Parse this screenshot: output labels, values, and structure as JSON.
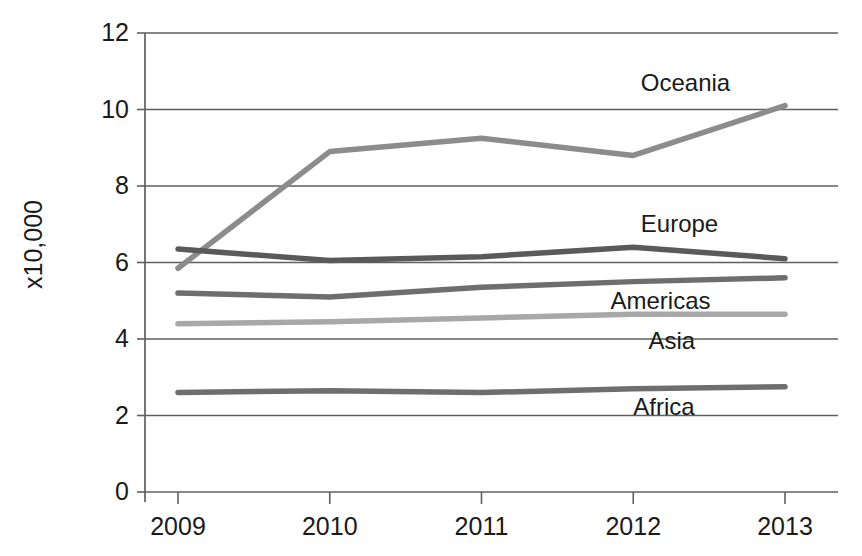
{
  "chart_data": {
    "type": "line",
    "title": "",
    "subtitle": "",
    "xlabel": "",
    "ylabel": "x10,000",
    "categories": [
      "2009",
      "2010",
      "2011",
      "2012",
      "2013"
    ],
    "x": [
      2009,
      2010,
      2011,
      2012,
      2013
    ],
    "xlim": [
      2008.8,
      2013.2
    ],
    "ylim": [
      0,
      12
    ],
    "yticks": [
      0,
      2,
      4,
      6,
      8,
      10,
      12
    ],
    "ytick_labels": [
      "0",
      "2",
      "4",
      "6",
      "8",
      "10",
      "12"
    ],
    "xtick_labels": [
      "2009",
      "2010",
      "2011",
      "2012",
      "2013"
    ],
    "grid": "horizontal",
    "legend_position": "inline-right-of-lines",
    "series": [
      {
        "name": "Oceania",
        "color": "#8c8c8c",
        "values": [
          5.85,
          8.9,
          9.25,
          8.8,
          10.1
        ],
        "label_x": 2012.05,
        "label_y": 10.65
      },
      {
        "name": "Europe",
        "color": "#5a5a5a",
        "values": [
          6.35,
          6.05,
          6.15,
          6.4,
          6.1
        ],
        "label_x": 2012.05,
        "label_y": 6.95
      },
      {
        "name": "Americas",
        "color": "#6e6e6e",
        "values": [
          5.2,
          5.1,
          5.35,
          5.5,
          5.6
        ],
        "label_x": 2011.85,
        "label_y": 4.95
      },
      {
        "name": "Asia",
        "color": "#a8a8a8",
        "values": [
          4.4,
          4.45,
          4.55,
          4.65,
          4.65
        ],
        "label_x": 2012.1,
        "label_y": 3.9
      },
      {
        "name": "Africa",
        "color": "#6e6e6e",
        "values": [
          2.6,
          2.65,
          2.6,
          2.7,
          2.75
        ],
        "label_x": 2012.0,
        "label_y": 2.18
      }
    ]
  }
}
